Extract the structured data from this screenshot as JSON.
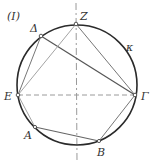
{
  "figure": {
    "label": "(I)",
    "circle": {
      "name": "κ",
      "cx": 77,
      "cy": 85,
      "r": 60,
      "color": "#2a2a2a"
    },
    "points": [
      {
        "name": "Z",
        "x": 76,
        "y": 24,
        "lx": 80,
        "ly": 20
      },
      {
        "name": "Δ",
        "x": 41,
        "y": 36,
        "lx": 30,
        "ly": 32
      },
      {
        "name": "E",
        "x": 18,
        "y": 95,
        "lx": 4,
        "ly": 100
      },
      {
        "name": "Γ",
        "x": 135,
        "y": 95,
        "lx": 141,
        "ly": 100
      },
      {
        "name": "A",
        "x": 35,
        "y": 127,
        "lx": 24,
        "ly": 139
      },
      {
        "name": "B",
        "x": 99,
        "y": 141,
        "lx": 97,
        "ly": 156
      }
    ],
    "kappa_label": {
      "text": "κ",
      "x": 127,
      "y": 50
    },
    "segments": [
      {
        "from": "Δ",
        "to": "Γ",
        "weight": "dark"
      },
      {
        "from": "Z",
        "to": "Γ",
        "weight": "medium"
      },
      {
        "from": "Z",
        "to": "E",
        "weight": "light"
      },
      {
        "from": "Δ",
        "to": "E",
        "weight": "medium"
      },
      {
        "from": "E",
        "to": "A",
        "weight": "light"
      },
      {
        "from": "A",
        "to": "B",
        "weight": "medium"
      },
      {
        "from": "B",
        "to": "Γ",
        "weight": "medium"
      }
    ],
    "axes": {
      "horizontal": {
        "x1": 18,
        "y1": 95,
        "x2": 135,
        "y2": 95,
        "dashed": true
      },
      "vertical": {
        "x1": 76,
        "y1": 3,
        "x2": 77,
        "y2": 160,
        "dashed": true
      }
    }
  }
}
